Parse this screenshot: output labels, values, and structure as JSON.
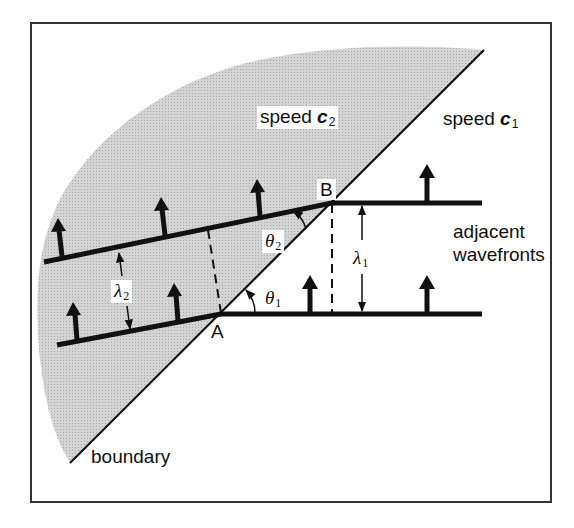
{
  "diagram": {
    "colors": {
      "frame": "#333333",
      "line": "#111111",
      "shade": "#cfcfcf",
      "background": "#ffffff"
    },
    "labels": {
      "speed_c2": {
        "text": "speed",
        "symbol": "c",
        "sub": "2"
      },
      "speed_c1": {
        "text": "speed",
        "symbol": "c",
        "sub": "1"
      },
      "point_a": "A",
      "point_b": "B",
      "theta_1": {
        "symbol": "θ",
        "sub": "1"
      },
      "theta_2": {
        "symbol": "θ",
        "sub": "2"
      },
      "lambda_1": {
        "symbol": "λ",
        "sub": "1"
      },
      "lambda_2": {
        "symbol": "λ",
        "sub": "2"
      },
      "adjacent_line1": "adjacent",
      "adjacent_line2": "wavefronts",
      "boundary": "boundary"
    },
    "regions": [
      {
        "name": "medium-2",
        "speed": "c2",
        "shaded": true
      },
      {
        "name": "medium-1",
        "speed": "c1",
        "shaded": false
      }
    ],
    "elements": {
      "boundary_line": {
        "from": [
          70,
          463
        ],
        "to": [
          484,
          50
        ]
      },
      "upper_wavefront_medium2": {
        "from": [
          44,
          262
        ],
        "to": [
          332,
          203
        ]
      },
      "upper_wavefront_medium1": {
        "from": [
          332,
          203
        ],
        "to": [
          482,
          203
        ]
      },
      "lower_wavefront_medium2": {
        "from": [
          57,
          345
        ],
        "to": [
          221,
          314
        ]
      },
      "lower_wavefront_medium1": {
        "from": [
          221,
          314
        ],
        "to": [
          482,
          314
        ]
      },
      "propagation_arrows_count": 8
    }
  }
}
